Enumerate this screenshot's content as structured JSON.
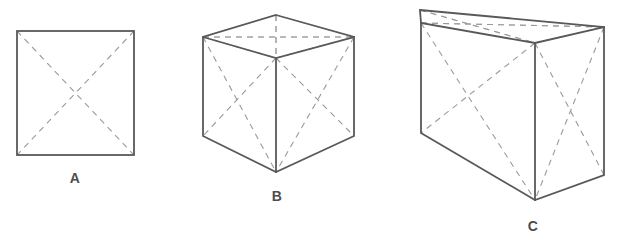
{
  "figure": {
    "background_color": "#ffffff",
    "solid_line_color": "#595959",
    "dashed_line_color": "#9a9a9a",
    "label_color": "#4d4d4d",
    "width": 622,
    "height": 244
  },
  "shapes": [
    {
      "id": "A",
      "label": "A",
      "kind": "square",
      "description": "Flat 2D square outline with dashed diagonals forming an X",
      "label_position": {
        "x": 75,
        "y": 178
      },
      "bounds": {
        "left": 17,
        "top": 31,
        "right": 134,
        "bottom": 155
      },
      "vertices": {
        "top_left": {
          "x": 17,
          "y": 31
        },
        "top_right": {
          "x": 134,
          "y": 31
        },
        "bottom_right": {
          "x": 134,
          "y": 155
        },
        "bottom_left": {
          "x": 17,
          "y": 155
        }
      }
    },
    {
      "id": "B",
      "label": "B",
      "kind": "cube",
      "description": "Three-dimensional cube drawn in perspective with dashed face diagonals on all six faces",
      "label_position": {
        "x": 277,
        "y": 196
      },
      "vertices": {
        "top_back": {
          "x": 276,
          "y": 15
        },
        "top_left": {
          "x": 203,
          "y": 37
        },
        "top_right": {
          "x": 354,
          "y": 37
        },
        "top_front": {
          "x": 276,
          "y": 58
        },
        "bottom_left": {
          "x": 203,
          "y": 136
        },
        "bottom_right": {
          "x": 354,
          "y": 136
        },
        "bottom_front": {
          "x": 276,
          "y": 172
        }
      }
    },
    {
      "id": "C",
      "label": "C",
      "kind": "cuboid",
      "description": "Elongated rectangular box (cuboid) drawn in perspective with dashed face diagonals",
      "label_position": {
        "x": 533,
        "y": 226
      },
      "vertices": {
        "top_back_left": {
          "x": 420,
          "y": 10
        },
        "top_back_right": {
          "x": 604,
          "y": 27
        },
        "top_front_left": {
          "x": 421,
          "y": 23
        },
        "top_front_right": {
          "x": 535,
          "y": 43
        },
        "bottom_left": {
          "x": 421,
          "y": 133
        },
        "bottom_front": {
          "x": 535,
          "y": 200
        },
        "bottom_right": {
          "x": 604,
          "y": 175
        }
      }
    }
  ]
}
